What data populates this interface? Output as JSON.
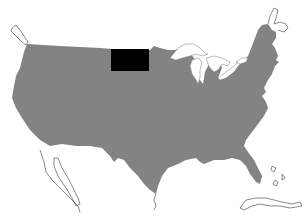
{
  "map": {
    "title": "United States",
    "highlighted_state": "North Dakota",
    "colors": {
      "land": "#838383",
      "highlight": "#000000",
      "water": "#ffffff",
      "outline": "#555555"
    },
    "features": [
      "contiguous-us",
      "north-dakota",
      "great-lakes",
      "vancouver-island",
      "baja-california",
      "cuba",
      "bahamas",
      "nova-scotia"
    ]
  }
}
